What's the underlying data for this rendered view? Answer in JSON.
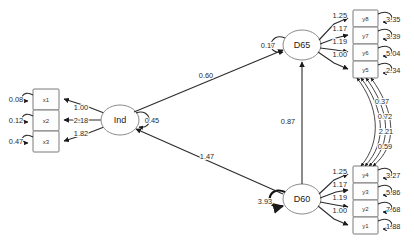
{
  "diagram": {
    "type": "sem-path-diagram",
    "latent_variables": [
      {
        "id": "ind",
        "label": "Ind",
        "variance": "0.45"
      },
      {
        "id": "d65",
        "label": "D65",
        "variance": "0.17"
      },
      {
        "id": "d60",
        "label": "D60",
        "variance": "3.93"
      }
    ],
    "observed_x": [
      {
        "id": "x1",
        "label": "x1",
        "residual": "0.08",
        "loading": "1.00"
      },
      {
        "id": "x2",
        "label": "x2",
        "residual": "0.12",
        "loading": "2.18"
      },
      {
        "id": "x3",
        "label": "x3",
        "residual": "0.47",
        "loading": "1.82"
      }
    ],
    "observed_y_upper": [
      {
        "id": "y8",
        "label": "y8",
        "residual": "3.35",
        "loading": "1.25"
      },
      {
        "id": "y7",
        "label": "y7",
        "residual": "3.39",
        "loading": "1.17"
      },
      {
        "id": "y6",
        "label": "y6",
        "residual": "5.04",
        "loading": "1.19"
      },
      {
        "id": "y5",
        "label": "y5",
        "residual": "2.34",
        "loading": "1.00"
      }
    ],
    "observed_y_lower": [
      {
        "id": "y4",
        "label": "y4",
        "residual": "3.27",
        "loading": "1.25"
      },
      {
        "id": "y3",
        "label": "y3",
        "residual": "5.86",
        "loading": "1.17"
      },
      {
        "id": "y2",
        "label": "y2",
        "residual": "7.68",
        "loading": "1.19"
      },
      {
        "id": "y1",
        "label": "y1",
        "residual": "1.88",
        "loading": "1.00"
      }
    ],
    "structural_paths": [
      {
        "id": "ind-to-d65",
        "from": "Ind",
        "to": "D65",
        "estimate": "0.60"
      },
      {
        "id": "d60-to-d65",
        "from": "D60",
        "to": "D65",
        "estimate": "0.87"
      },
      {
        "id": "d60-to-ind",
        "from": "D60",
        "to": "Ind",
        "estimate": "1.47"
      }
    ],
    "residual_covariances": [
      {
        "id": "cov-1",
        "estimate": "0.37"
      },
      {
        "id": "cov-2",
        "estimate": "0.72"
      },
      {
        "id": "cov-3",
        "estimate": "2.21"
      },
      {
        "id": "cov-4",
        "estimate": "0.59"
      }
    ],
    "colors": {
      "background": "#ffffff",
      "edge": "#2b2b2b",
      "node_stroke": "#7a7a7a",
      "text": "#1a1a1a"
    }
  }
}
